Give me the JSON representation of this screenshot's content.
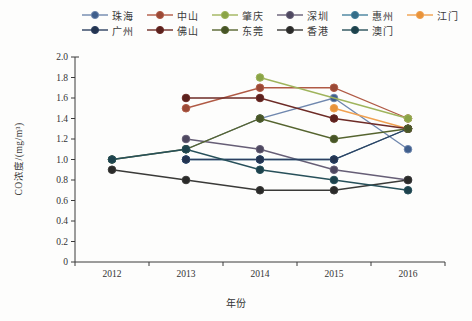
{
  "chart_data": {
    "type": "line",
    "title": "",
    "xlabel": "年份",
    "ylabel": "CO浓度/(mg/m³)",
    "x": [
      "2012",
      "2013",
      "2014",
      "2015",
      "2016"
    ],
    "ylim": [
      0,
      2.0
    ],
    "ytick_step": 0.2,
    "ytick_labels": [
      "0",
      "0.2",
      "0.4",
      "0.6",
      "0.8",
      "1.0",
      "1.2",
      "1.4",
      "1.6",
      "1.8",
      "2.0"
    ],
    "grid": false,
    "legend_position": "top",
    "legend_rows": [
      6,
      5
    ],
    "series": [
      {
        "name": "珠海",
        "color": "#6f87ae",
        "marker_color": "#3f5e8c",
        "values": [
          null,
          1.1,
          1.4,
          1.6,
          1.1
        ]
      },
      {
        "name": "中山",
        "color": "#b05a45",
        "marker_color": "#9a4936",
        "values": [
          null,
          1.5,
          1.7,
          1.7,
          1.4
        ]
      },
      {
        "name": "肇庆",
        "color": "#9fb45c",
        "marker_color": "#8aa446",
        "values": [
          null,
          null,
          1.8,
          null,
          1.4
        ]
      },
      {
        "name": "深圳",
        "color": "#665e76",
        "marker_color": "#4e4860",
        "values": [
          null,
          1.2,
          1.1,
          0.9,
          0.8
        ]
      },
      {
        "name": "惠州",
        "color": "#45829e",
        "marker_color": "#356d88",
        "values": [
          null,
          1.0,
          1.0,
          1.0,
          1.3
        ]
      },
      {
        "name": "江门",
        "color": "#f0a150",
        "marker_color": "#e8933a",
        "values": [
          null,
          null,
          null,
          1.5,
          1.3
        ]
      },
      {
        "name": "广州",
        "color": "#2d4061",
        "marker_color": "#233450",
        "values": [
          null,
          1.0,
          1.0,
          1.0,
          1.3
        ]
      },
      {
        "name": "佛山",
        "color": "#6d2b26",
        "marker_color": "#5b211d",
        "values": [
          null,
          1.6,
          1.6,
          1.4,
          1.3
        ]
      },
      {
        "name": "东莞",
        "color": "#55642f",
        "marker_color": "#475427",
        "values": [
          1.0,
          1.1,
          1.4,
          1.2,
          1.3
        ]
      },
      {
        "name": "香港",
        "color": "#3a3a38",
        "marker_color": "#2a2a29",
        "values": [
          0.9,
          0.8,
          0.7,
          0.7,
          0.8
        ]
      },
      {
        "name": "澳门",
        "color": "#27505a",
        "marker_color": "#1d424c",
        "values": [
          1.0,
          1.1,
          0.9,
          0.8,
          0.7
        ]
      }
    ],
    "axis_color": "#3a3a3a"
  }
}
